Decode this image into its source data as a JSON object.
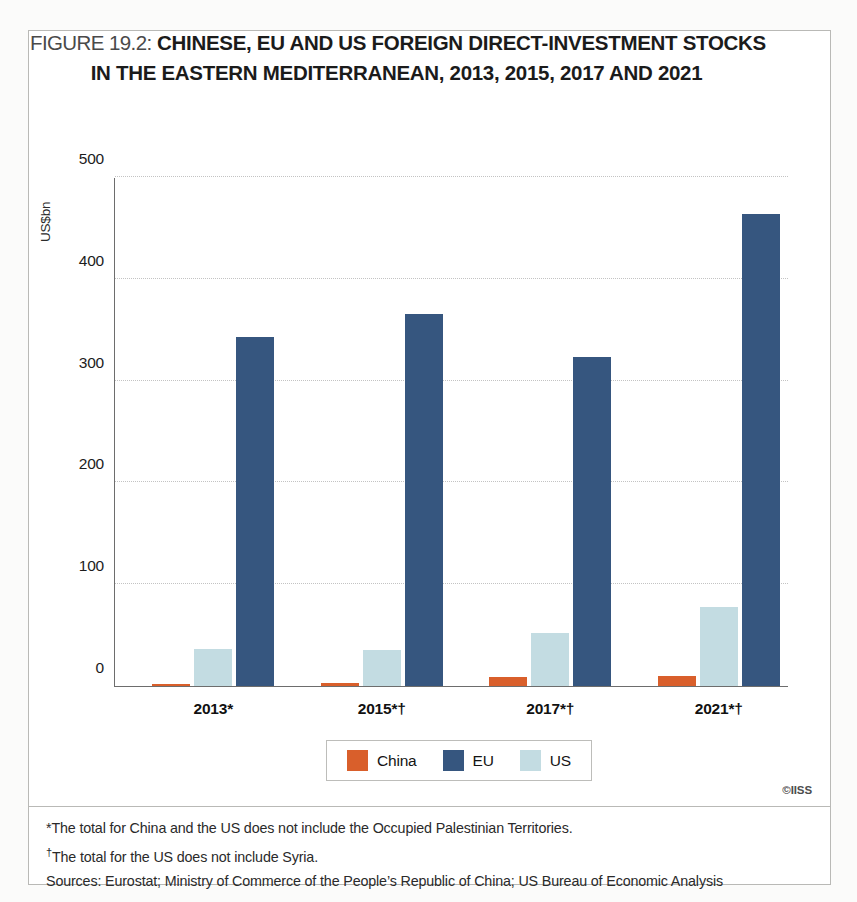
{
  "figure": {
    "number_label": "FIGURE 19.2:",
    "title_line1": "CHINESE, EU AND US FOREIGN DIRECT-INVESTMENT STOCKS",
    "title_line2": "IN THE EASTERN MEDITERRANEAN, 2013, 2015, 2017 AND 2021",
    "copyright": "©IISS"
  },
  "notes": {
    "line1": "*The total for China and the US does not include the Occupied Palestinian Territories.",
    "line2_marker": "†",
    "line2": "The total for the US does not include Syria.",
    "line3": "Sources: Eurostat; Ministry of Commerce of the People’s Republic of China; US Bureau of Economic Analysis"
  },
  "legend": {
    "items": [
      {
        "label": "China",
        "color": "#d95f2b"
      },
      {
        "label": "EU",
        "color": "#36567f"
      },
      {
        "label": "US",
        "color": "#c3dce2"
      }
    ]
  },
  "chart_data": {
    "type": "bar",
    "title": "CHINESE, EU AND US FOREIGN DIRECT-INVESTMENT STOCKS IN THE EASTERN MEDITERRANEAN, 2013, 2015, 2017 AND 2021",
    "xlabel": "",
    "ylabel": "US$bn",
    "ylim": [
      0,
      500
    ],
    "yticks": [
      0,
      100,
      200,
      300,
      400,
      500
    ],
    "ytick_labels": [
      "0",
      "100",
      "200",
      "300",
      "400",
      "500"
    ],
    "grid": true,
    "legend_position": "bottom",
    "categories": [
      "2013*",
      "2015*†",
      "2017*†",
      "2021*†"
    ],
    "series": [
      {
        "name": "China",
        "color": "#d95f2b",
        "values": [
          2,
          3,
          9,
          10
        ]
      },
      {
        "name": "US",
        "color": "#c3dce2",
        "values": [
          36,
          35,
          52,
          78
        ]
      },
      {
        "name": "EU",
        "color": "#36567f",
        "values": [
          343,
          365,
          323,
          464
        ]
      }
    ]
  }
}
